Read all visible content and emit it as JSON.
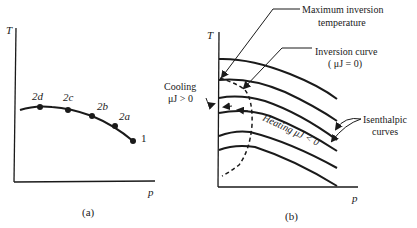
{
  "panel_a": {
    "caption": "(a)",
    "y_axis_label": "T",
    "x_axis_label": "p",
    "points": [
      {
        "label": "2d",
        "x": 40,
        "y": 107
      },
      {
        "label": "2c",
        "x": 68,
        "y": 110
      },
      {
        "label": "2b",
        "x": 92,
        "y": 116
      },
      {
        "label": "2a",
        "x": 115,
        "y": 126
      },
      {
        "label": "1",
        "x": 133,
        "y": 141
      }
    ]
  },
  "panel_b": {
    "caption": "(b)",
    "y_axis_label": "T",
    "x_axis_label": "p",
    "annotations": {
      "max_inversion_line1": "Maximum inversion",
      "max_inversion_line2": "temperature",
      "inversion_curve_line1": "Inversion curve",
      "inversion_curve_line2": "( μJ = 0)",
      "cooling_line1": "Cooling",
      "cooling_line2": "μJ > 0",
      "heating": "Heating μJ < 0",
      "isenthalpic_line1": "Isenthalpic",
      "isenthalpic_line2": "curves"
    }
  }
}
